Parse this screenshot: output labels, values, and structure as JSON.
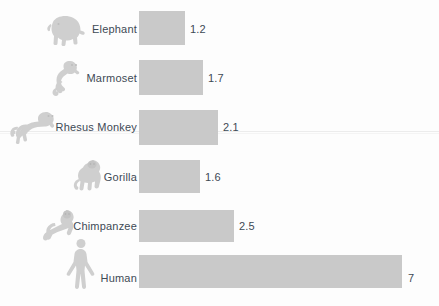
{
  "chart_data": {
    "type": "bar",
    "orientation": "horizontal",
    "title": "",
    "subtitle": "",
    "xlabel": "",
    "ylabel": "",
    "grid": false,
    "legend": false,
    "axis_visible": false,
    "categories": [
      "Elephant",
      "Marmoset",
      "Rhesus Monkey",
      "Gorilla",
      "Chimpanzee",
      "Human"
    ],
    "values": [
      1.2,
      1.7,
      2.1,
      1.6,
      2.5,
      7
    ],
    "value_labels": [
      "1.2",
      "1.7",
      "2.1",
      "1.6",
      "2.5",
      "7"
    ],
    "xlim": [
      0,
      7
    ],
    "bar_color": "#c9c9c9",
    "text_color": "#3e4a55",
    "background_color": "#fdfdfd",
    "icons": [
      "elephant-icon",
      "marmoset-icon",
      "rhesus-monkey-icon",
      "gorilla-icon",
      "chimpanzee-icon",
      "human-icon"
    ]
  },
  "rows": [
    {
      "label": "Elephant",
      "value_label": "1.2",
      "icon": "elephant-icon",
      "label_right": 137,
      "label_top": 23,
      "bar_left": 139,
      "bar_top": 11,
      "bar_width": 46,
      "bar_height": 34,
      "value_left": 190,
      "value_top": 23,
      "icon_left": 43,
      "icon_top": 14,
      "icon_width": 48,
      "icon_height": 30
    },
    {
      "label": "Marmoset",
      "value_label": "1.7",
      "icon": "marmoset-icon",
      "label_right": 137,
      "label_top": 72,
      "bar_left": 139,
      "bar_top": 60,
      "bar_width": 64,
      "bar_height": 35,
      "value_left": 208,
      "value_top": 72,
      "icon_left": 50,
      "icon_top": 58,
      "icon_width": 36,
      "icon_height": 38
    },
    {
      "label": "Rhesus Monkey",
      "value_label": "2.1",
      "icon": "rhesus-monkey-icon",
      "label_right": 137,
      "label_top": 121,
      "bar_left": 139,
      "bar_top": 110,
      "bar_width": 79,
      "bar_height": 35,
      "value_left": 223,
      "value_top": 121,
      "icon_left": 10,
      "icon_top": 108,
      "icon_width": 52,
      "icon_height": 34
    },
    {
      "label": "Gorilla",
      "value_label": "1.6",
      "icon": "gorilla-icon",
      "label_right": 137,
      "label_top": 171,
      "bar_left": 139,
      "bar_top": 160,
      "bar_width": 61,
      "bar_height": 33,
      "value_left": 205,
      "value_top": 171,
      "icon_left": 72,
      "icon_top": 158,
      "icon_width": 32,
      "icon_height": 36
    },
    {
      "label": "Chimpanzee",
      "value_label": "2.5",
      "icon": "chimpanzee-icon",
      "label_right": 137,
      "label_top": 220,
      "bar_left": 139,
      "bar_top": 210,
      "bar_width": 95,
      "bar_height": 32,
      "value_left": 239,
      "value_top": 220,
      "icon_left": 40,
      "icon_top": 208,
      "icon_width": 38,
      "icon_height": 34
    },
    {
      "label": "Human",
      "value_label": "7",
      "icon": "human-icon",
      "label_right": 137,
      "label_top": 272,
      "bar_left": 139,
      "bar_top": 255,
      "bar_width": 263,
      "bar_height": 33,
      "value_left": 408,
      "value_top": 272,
      "icon_left": 62,
      "icon_top": 238,
      "icon_width": 38,
      "icon_height": 58
    }
  ]
}
